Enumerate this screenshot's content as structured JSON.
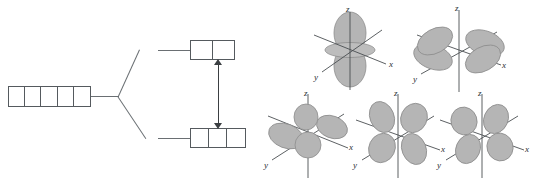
{
  "figure": {
    "line_color": "#6a6f73",
    "box_border_color": "#555a5e",
    "arrow_color": "#3b3f42",
    "lobe_fill": "#b5b5b5",
    "lobe_stroke": "#8d8d8d",
    "axis_color": "#4a4e51"
  },
  "splitting_diagram": {
    "name": "crystal-field-splitting-diagram",
    "free_ion_level": {
      "name": "five-degenerate-d-orbitals",
      "cell_count": 5,
      "cells": [
        "",
        "",
        "",
        "",
        ""
      ]
    },
    "upper_level": {
      "name": "eg-set",
      "cell_count": 2,
      "cells": [
        "",
        ""
      ]
    },
    "lower_level": {
      "name": "t2g-set",
      "cell_count": 3,
      "cells": [
        "",
        "",
        ""
      ]
    },
    "splitting_arrow": {
      "name": "splitting-energy-arrow",
      "style": "double-headed-vertical",
      "label": ""
    }
  },
  "orbital_gallery": {
    "name": "d-orbital-shape-gallery",
    "rows": 2,
    "axes": {
      "z": "z",
      "x": "x",
      "y": "y"
    },
    "orbitals": [
      {
        "name": "orbital-dz2",
        "shape": "dz2",
        "row": 0,
        "col": 0,
        "caption": ""
      },
      {
        "name": "orbital-dx2y2",
        "shape": "dx2-y2",
        "row": 0,
        "col": 1,
        "caption": ""
      },
      {
        "name": "orbital-dxy",
        "shape": "dxy",
        "row": 1,
        "col": 0,
        "caption": ""
      },
      {
        "name": "orbital-dxz",
        "shape": "dxz",
        "row": 1,
        "col": 1,
        "caption": ""
      },
      {
        "name": "orbital-dyz",
        "shape": "dyz",
        "row": 1,
        "col": 2,
        "caption": ""
      }
    ]
  }
}
